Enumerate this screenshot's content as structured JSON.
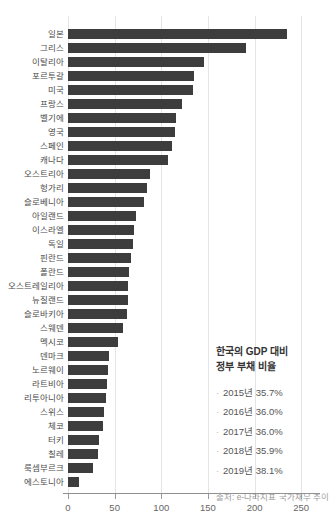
{
  "chart_data": {
    "type": "bar",
    "orientation": "horizontal",
    "title": "",
    "xlabel": "",
    "ylabel": "",
    "categories": [
      "일본",
      "그리스",
      "이탈리아",
      "포르투갈",
      "미국",
      "프랑스",
      "벨기에",
      "영국",
      "스페인",
      "캐나다",
      "오스트리아",
      "헝가리",
      "슬로베니아",
      "아일랜드",
      "이스라엘",
      "독일",
      "핀란드",
      "폴란드",
      "오스트레일리아",
      "뉴질랜드",
      "슬로바키아",
      "스웨덴",
      "멕시코",
      "덴마크",
      "노르웨이",
      "라트비아",
      "리투아니아",
      "스위스",
      "체코",
      "터키",
      "칠레",
      "룩셈부르크",
      "에스토니아"
    ],
    "values": [
      235,
      191,
      146,
      135,
      134,
      122,
      116,
      115,
      112,
      107,
      88,
      85,
      81,
      73,
      71,
      70,
      67,
      65,
      64.5,
      64,
      63,
      59,
      54,
      44,
      43,
      41.5,
      40.5,
      39,
      38,
      33.5,
      32,
      26.5,
      12
    ],
    "xticks": [
      0,
      50,
      100,
      150,
      200,
      250
    ],
    "xlim": [
      0,
      268
    ],
    "grid": true,
    "bar_color": "#3d3d3d",
    "gridline_color": "#e4e4e4"
  },
  "annotation": {
    "title_line1": "한국의 GDP 대비",
    "title_line2": "정부 부채 비율",
    "items": [
      "2015년 35.7%",
      "2016년 36.0%",
      "2017년 36.0%",
      "2018년 35.9%",
      "2019년 38.1%"
    ],
    "source": "출처: e-나라지표 국가채무 추이"
  }
}
